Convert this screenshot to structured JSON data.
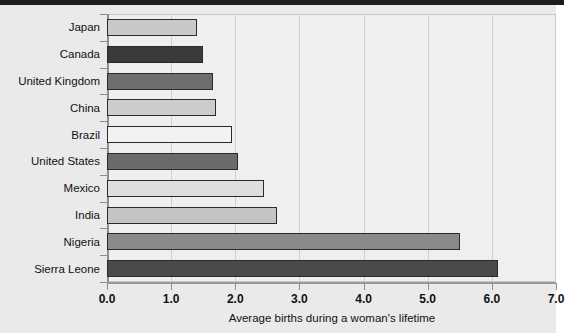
{
  "chart_data": {
    "type": "bar",
    "orientation": "horizontal",
    "title": "",
    "xlabel": "Average births during a woman's lifetime",
    "ylabel": "",
    "xlim": [
      0.0,
      7.0
    ],
    "xticks": [
      "0.0",
      "1.0",
      "2.0",
      "3.0",
      "4.0",
      "5.0",
      "6.0",
      "7.0"
    ],
    "xtick_values": [
      0,
      1,
      2,
      3,
      4,
      5,
      6,
      7
    ],
    "grid": "vertical",
    "legend": "none",
    "categories": [
      "Japan",
      "Canada",
      "United Kingdom",
      "China",
      "Brazil",
      "United States",
      "Mexico",
      "India",
      "Nigeria",
      "Sierra Leone"
    ],
    "values": [
      1.4,
      1.5,
      1.65,
      1.7,
      1.95,
      2.05,
      2.45,
      2.65,
      5.5,
      6.1
    ],
    "bar_colors": [
      "#c8c8c8",
      "#3a3a3a",
      "#6e6e6e",
      "#cccccc",
      "#f2f2f2",
      "#6b6b6b",
      "#dedede",
      "#c4c4c4",
      "#8a8a8a",
      "#4a4a4a"
    ],
    "bar_edge_color": "#2b2b2b",
    "plot_background": "#efefef",
    "page_background": "#eaeaea",
    "gridline_color": "#cfcfcf",
    "axis_color": "#8e8e8e",
    "text_color": "#111111"
  }
}
